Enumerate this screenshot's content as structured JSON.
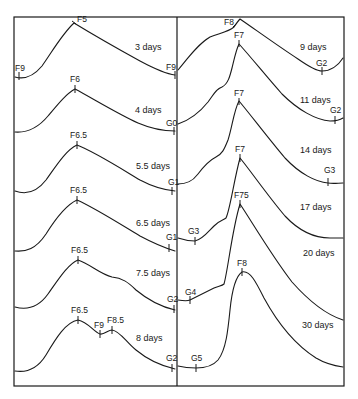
{
  "figure": {
    "type": "developmental stage curves",
    "panels": [
      {
        "side": "left",
        "curves": [
          {
            "duration": "3 days",
            "start": "F9",
            "peak": "F5",
            "end": "F9"
          },
          {
            "duration": "4 days",
            "peak": "F6",
            "end": "G0"
          },
          {
            "duration": "5.5 days",
            "peak": "F6.5",
            "end": "G1"
          },
          {
            "duration": "6.5 days",
            "peak": "F6.5",
            "end": "G1"
          },
          {
            "duration": "7.5 days",
            "peak": "F6.5",
            "end": "G2"
          },
          {
            "duration": "8 days",
            "peak": "F6.5",
            "trough": "F9",
            "second_peak": "F8.5",
            "end": "G2"
          }
        ]
      },
      {
        "side": "right",
        "curves": [
          {
            "duration": "9 days",
            "peak": "F8",
            "end": "G2"
          },
          {
            "duration": "11 days",
            "peak": "F7",
            "end": "G2"
          },
          {
            "duration": "14 days",
            "peak": "F7",
            "end": "G3"
          },
          {
            "duration": "17 days",
            "start": "G3",
            "peak": "F7",
            "end": ""
          },
          {
            "duration": "20 days",
            "start": "G4",
            "peak": "F7.5",
            "end": ""
          },
          {
            "duration": "30 days",
            "start": "G5",
            "peak": "F8",
            "end": ""
          }
        ]
      }
    ]
  },
  "labels": {
    "l0_start": "F9",
    "l0_peak": "F5",
    "l0_end": "F9",
    "l0_dur": "3 days",
    "l1_peak": "F6",
    "l1_end": "G0",
    "l1_dur": "4 days",
    "l2_peak": "F6.5",
    "l2_end": "G1",
    "l2_dur": "5.5 days",
    "l3_peak": "F6.5",
    "l3_end": "G1",
    "l3_dur": "6.5 days",
    "l4_peak": "F6.5",
    "l4_end": "G2",
    "l4_dur": "7.5 days",
    "l5_peak": "F6.5",
    "l5_trough": "F9",
    "l5_peak2": "F8.5",
    "l5_end": "G2",
    "l5_dur": "8 days",
    "r0_peak": "F8",
    "r0_end": "G2",
    "r0_dur": "9 days",
    "r1_peak": "F7",
    "r1_end": "G2",
    "r1_dur": "11 days",
    "r2_peak": "F7",
    "r2_end": "G3",
    "r2_dur": "14 days",
    "r3_start": "G3",
    "r3_peak": "F7",
    "r3_dur": "17 days",
    "r4_start": "G4",
    "r4_peak": "F75",
    "r4_dur": "20 days",
    "r5_start": "G5",
    "r5_peak": "F8",
    "r5_dur": "30 days"
  }
}
